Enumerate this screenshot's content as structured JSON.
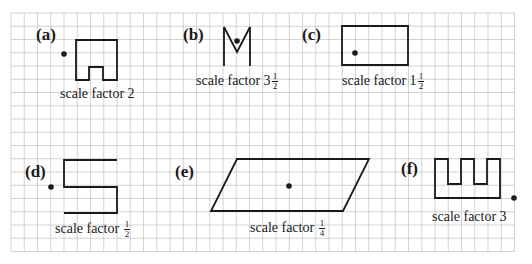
{
  "grid": {
    "x0": 11,
    "y0": 13,
    "cell": 13.25,
    "cols": 38,
    "rows": 18,
    "color": "#c8c8c8",
    "line_color": "#1a1a1a"
  },
  "problems": [
    {
      "id": "a",
      "label": "(a)",
      "caption_text": "scale factor 2",
      "caption_whole": "",
      "caption_frac_num": "",
      "caption_frac_den": "",
      "label_pos": [
        36,
        26
      ],
      "caption_pos": [
        60,
        87
      ],
      "shape": "76,40 117,40 117,80 103,80 103,67 89,67 89,80 76,80",
      "closed": true,
      "centre": [
        64,
        54
      ]
    },
    {
      "id": "b",
      "label": "(b)",
      "caption_text": "scale factor 3",
      "caption_whole": "3",
      "caption_frac_num": "1",
      "caption_frac_den": "2",
      "label_pos": [
        183,
        26
      ],
      "caption_pos": [
        196,
        72
      ],
      "shape": "224,27 237,52 250,27",
      "shape2": "224,27 224,66",
      "shape3": "250,27 250,66",
      "closed": false,
      "centre": [
        237,
        41
      ]
    },
    {
      "id": "c",
      "label": "(c)",
      "caption_text": "scale factor 1",
      "caption_whole": "1",
      "caption_frac_num": "1",
      "caption_frac_den": "2",
      "label_pos": [
        302,
        26
      ],
      "caption_pos": [
        342,
        72
      ],
      "shape": "342,26 408,26 408,65 342,65",
      "closed": true,
      "centre": [
        355,
        53
      ]
    },
    {
      "id": "d",
      "label": "(d)",
      "caption_text": "scale factor",
      "caption_whole": "",
      "caption_frac_num": "1",
      "caption_frac_den": "2",
      "label_pos": [
        25,
        163
      ],
      "caption_pos": [
        55,
        220
      ],
      "shape": "117,160 64,160 64,187 117,187 117,213 64,213",
      "closed": false,
      "centre": [
        51,
        187
      ]
    },
    {
      "id": "e",
      "label": "(e)",
      "caption_text": "scale factor",
      "caption_whole": "",
      "caption_frac_num": "1",
      "caption_frac_den": "4",
      "label_pos": [
        175,
        163
      ],
      "caption_pos": [
        250,
        219
      ],
      "shape": "237,159 369,159 343,211 211,211",
      "closed": true,
      "centre": [
        289,
        186
      ]
    },
    {
      "id": "f",
      "label": "(f)",
      "caption_text": "scale factor 3",
      "caption_whole": "",
      "caption_frac_num": "",
      "caption_frac_den": "",
      "label_pos": [
        401,
        160
      ],
      "caption_pos": [
        432,
        210
      ],
      "shape": "435,159 448,159 448,184 461,184 461,159 474,159 474,184 487,184 487,159 500,159 500,198 435,198",
      "closed": true,
      "centre": [
        514,
        198
      ]
    }
  ]
}
